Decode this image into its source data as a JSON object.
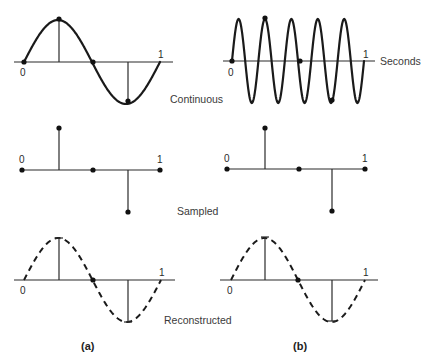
{
  "figure": {
    "rows": [
      {
        "id": "continuous",
        "label": "Continuous"
      },
      {
        "id": "sampled",
        "label": "Sampled"
      },
      {
        "id": "reconstructed",
        "label": "Reconstructed"
      }
    ],
    "axis_unit_label": "Seconds",
    "tick_start": "0",
    "tick_end": "1",
    "panels": [
      {
        "id": "a",
        "caption": "(a)",
        "signal_frequency_hz": 1
      },
      {
        "id": "b",
        "caption": "(b)",
        "signal_frequency_hz": 5
      }
    ],
    "sample_times": [
      0,
      0.25,
      0.5,
      0.75,
      1.0
    ],
    "sample_values": [
      0,
      1,
      0,
      -1,
      0
    ],
    "reconstructed_frequency_hz": 1,
    "colors": {
      "ink": "#1a1a1a",
      "background": "#ffffff"
    }
  }
}
